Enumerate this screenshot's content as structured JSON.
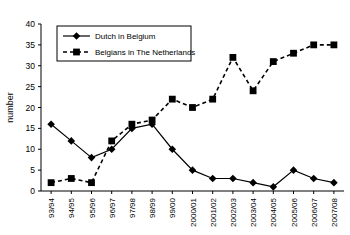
{
  "chart_data": {
    "type": "line",
    "title": "",
    "xlabel": "",
    "ylabel": "number",
    "ylim": [
      0,
      40
    ],
    "ytick_step": 5,
    "yticks": [
      "0",
      "5",
      "10",
      "15",
      "20",
      "25",
      "30",
      "35",
      "40"
    ],
    "grid": false,
    "legend_position": "top-left",
    "categories": [
      "93/94",
      "94/95",
      "95/96",
      "96/97",
      "97/98",
      "98/99",
      "99/00",
      "2000/01",
      "2001/02",
      "2002/03",
      "2003/04",
      "2004/05",
      "2005/06",
      "2006/07",
      "2007/08"
    ],
    "series": [
      {
        "name": "Dutch in Belgium",
        "marker": "diamond",
        "line_style": "solid",
        "color": "#000000",
        "values": [
          16,
          12,
          8,
          10,
          15,
          16,
          10,
          5,
          3,
          3,
          2,
          1,
          5,
          3,
          2
        ]
      },
      {
        "name": "Belgians in The Netherlands",
        "marker": "square",
        "line_style": "dashed",
        "color": "#000000",
        "values": [
          2,
          3,
          2,
          12,
          16,
          17,
          22,
          20,
          22,
          32,
          24,
          31,
          33,
          35,
          35
        ]
      }
    ]
  },
  "legend": {
    "entries": [
      {
        "label": "Dutch in Belgium"
      },
      {
        "label": "Belgians in The Netherlands"
      }
    ]
  },
  "axes": {
    "y_axis_title": "number"
  }
}
